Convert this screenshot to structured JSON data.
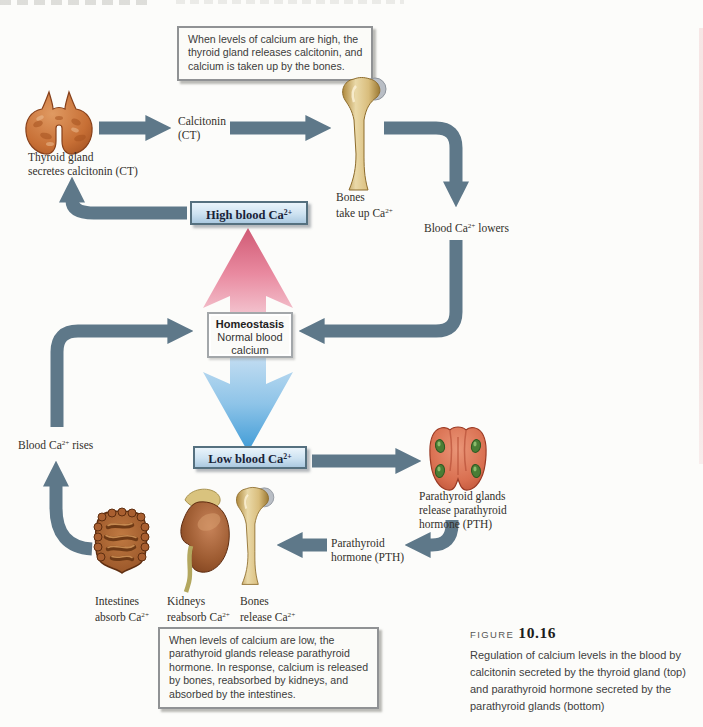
{
  "callouts": {
    "high": {
      "lines": [
        "When levels of calcium are high, the",
        "thyroid gland releases calcitonin, and",
        "calcium is taken up by the bones."
      ]
    },
    "low": {
      "lines": [
        "When levels of calcium are low, the",
        "parathyroid glands release parathyroid",
        "hormone. In response, calcium is released",
        "by bones, reabsorbed by kidneys, and",
        "absorbed by the intestines."
      ]
    }
  },
  "nodes": {
    "thyroid": {
      "line1": "Thyroid gland",
      "line2": "secretes calcitonin (CT)"
    },
    "calcitonin": {
      "line1": "Calcitonin",
      "line2": "(CT)"
    },
    "bones_top": {
      "line1": "Bones",
      "line2_pre": "take up Ca",
      "line2_sup": "2+"
    },
    "blood_lowers": {
      "pre": "Blood Ca",
      "sup": "2+",
      "post": " lowers"
    },
    "high_blood": {
      "pre": "High blood Ca",
      "sup": "2+"
    },
    "homeostasis": {
      "title": "Homeostasis",
      "body": "Normal blood calcium"
    },
    "low_blood": {
      "pre": "Low blood Ca",
      "sup": "2+"
    },
    "blood_rises": {
      "pre": "Blood Ca",
      "sup": "2+",
      "post": " rises"
    },
    "parathyroid": {
      "line1": "Parathyroid glands",
      "line2": "release parathyroid",
      "line3": "hormone (PTH)"
    },
    "pth": {
      "line1": "Parathyroid",
      "line2": "hormone (PTH)"
    },
    "intestines": {
      "line1": "Intestines",
      "line2_pre": "absorb Ca",
      "line2_sup": "2+"
    },
    "kidneys": {
      "line1": "Kidneys",
      "line2_pre": "reabsorb Ca",
      "line2_sup": "2+"
    },
    "bones_bottom": {
      "line1": "Bones",
      "line2_pre": "release Ca",
      "line2_sup": "2+"
    }
  },
  "figure_caption": {
    "label": "FIGURE",
    "number": "10.16",
    "lines": [
      "Regulation of calcium levels in the blood by",
      "calcitonin secreted by the thyroid gland (top)",
      "and parathyroid hormone secreted by the",
      "parathyroid glands (bottom)"
    ]
  },
  "colors": {
    "flow_arrow": "#5e7889",
    "rise_arrow_top": "#d05a74",
    "rise_arrow_bottom": "#f7d9e0",
    "fall_arrow_top": "#cfe3f4",
    "fall_arrow_tip": "#3d9ad6",
    "blood_box_border": "#55707f",
    "callout_border": "#909294"
  }
}
